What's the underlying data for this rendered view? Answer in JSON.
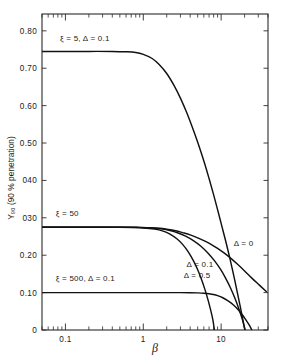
{
  "chart_data": {
    "type": "line",
    "title": "",
    "xlabel": "β",
    "ylabel": "Y₉₀ (90 % penetration)",
    "xscale": "log",
    "yscale": "linear",
    "xlim": [
      0.05,
      40
    ],
    "ylim": [
      0,
      0.845
    ],
    "grid": false,
    "legend_position": "inline-annotations",
    "xtick_labels": [
      "0.1",
      "1",
      "10"
    ],
    "xtick_values": [
      0.1,
      1,
      10
    ],
    "ytick_labels": [
      "0",
      "0.10",
      "0.20",
      "030",
      "040",
      "0.50",
      "0.60",
      "0.70",
      "0.80"
    ],
    "ytick_values": [
      0,
      0.1,
      0.2,
      0.3,
      0.4,
      0.5,
      0.6,
      0.7,
      0.8
    ],
    "annotations": [
      {
        "text": "ξ = 5, Δ = 0.1",
        "x": 0.085,
        "y": 0.772
      },
      {
        "text": "ξ = 50",
        "x": 0.075,
        "y": 0.305
      },
      {
        "text": "ξ = 500, Δ = 0.1",
        "x": 0.075,
        "y": 0.132
      },
      {
        "text": "Δ = 0",
        "x": 14.5,
        "y": 0.224
      },
      {
        "text": "Δ = 0.1",
        "x": 3.6,
        "y": 0.168
      },
      {
        "text": "Δ = 0.5",
        "x": 3.3,
        "y": 0.14
      }
    ],
    "series": [
      {
        "name": "ξ = 5, Δ = 0.1",
        "plateau": 0.745,
        "points": [
          [
            0.05,
            0.745
          ],
          [
            0.1,
            0.745
          ],
          [
            0.2,
            0.745
          ],
          [
            0.4,
            0.745
          ],
          [
            0.6,
            0.744
          ],
          [
            0.8,
            0.742
          ],
          [
            1.0,
            0.737
          ],
          [
            1.3,
            0.726
          ],
          [
            1.6,
            0.71
          ],
          [
            2.0,
            0.686
          ],
          [
            2.5,
            0.653
          ],
          [
            3.0,
            0.62
          ],
          [
            3.6,
            0.582
          ],
          [
            4.3,
            0.54
          ],
          [
            5.0,
            0.502
          ],
          [
            6.0,
            0.452
          ],
          [
            7.0,
            0.405
          ],
          [
            8.0,
            0.362
          ],
          [
            9.0,
            0.322
          ],
          [
            10.0,
            0.285
          ],
          [
            11.5,
            0.236
          ],
          [
            13.0,
            0.19
          ],
          [
            15.0,
            0.132
          ],
          [
            17.0,
            0.078
          ],
          [
            19.0,
            0.028
          ],
          [
            20.2,
            0.0
          ]
        ]
      },
      {
        "name": "ξ = 50, Δ = 0",
        "plateau": 0.275,
        "points": [
          [
            0.05,
            0.275
          ],
          [
            0.3,
            0.275
          ],
          [
            0.8,
            0.2745
          ],
          [
            1.2,
            0.2735
          ],
          [
            1.6,
            0.272
          ],
          [
            2.0,
            0.2695
          ],
          [
            2.6,
            0.2655
          ],
          [
            3.2,
            0.2605
          ],
          [
            4.0,
            0.2545
          ],
          [
            5.0,
            0.2465
          ],
          [
            6.2,
            0.2375
          ],
          [
            7.5,
            0.2285
          ],
          [
            9.0,
            0.2185
          ],
          [
            11.0,
            0.2055
          ],
          [
            13.0,
            0.1935
          ],
          [
            16.0,
            0.177
          ],
          [
            20.0,
            0.158
          ],
          [
            25.0,
            0.138
          ],
          [
            31.0,
            0.12
          ],
          [
            38.0,
            0.103
          ]
        ]
      },
      {
        "name": "ξ = 50, Δ = 0.1",
        "plateau": 0.275,
        "points": [
          [
            0.05,
            0.275
          ],
          [
            0.4,
            0.275
          ],
          [
            0.9,
            0.2745
          ],
          [
            1.3,
            0.273
          ],
          [
            1.7,
            0.2705
          ],
          [
            2.2,
            0.266
          ],
          [
            2.8,
            0.2595
          ],
          [
            3.5,
            0.251
          ],
          [
            4.4,
            0.239
          ],
          [
            5.5,
            0.224
          ],
          [
            6.8,
            0.2055
          ],
          [
            8.2,
            0.1855
          ],
          [
            9.8,
            0.1625
          ],
          [
            11.5,
            0.1375
          ],
          [
            13.2,
            0.1125
          ],
          [
            15.0,
            0.0855
          ],
          [
            17.0,
            0.055
          ],
          [
            18.8,
            0.027
          ],
          [
            20.3,
            0.0
          ]
        ]
      },
      {
        "name": "ξ = 50, Δ = 0.5",
        "plateau": 0.275,
        "points": [
          [
            0.05,
            0.275
          ],
          [
            0.5,
            0.2748
          ],
          [
            1.0,
            0.273
          ],
          [
            1.4,
            0.27
          ],
          [
            1.8,
            0.2645
          ],
          [
            2.2,
            0.2565
          ],
          [
            2.7,
            0.244
          ],
          [
            3.2,
            0.229
          ],
          [
            3.8,
            0.2085
          ],
          [
            4.4,
            0.1855
          ],
          [
            5.0,
            0.161
          ],
          [
            5.6,
            0.135
          ],
          [
            6.2,
            0.108
          ],
          [
            6.8,
            0.08
          ],
          [
            7.3,
            0.055
          ],
          [
            7.8,
            0.029
          ],
          [
            8.2,
            0.0
          ]
        ]
      },
      {
        "name": "ξ = 500, Δ = 0.1",
        "plateau": 0.1,
        "points": [
          [
            0.05,
            0.1
          ],
          [
            1.0,
            0.1
          ],
          [
            2.0,
            0.1
          ],
          [
            3.0,
            0.0999
          ],
          [
            4.0,
            0.0997
          ],
          [
            5.0,
            0.0993
          ],
          [
            6.0,
            0.0985
          ],
          [
            7.0,
            0.097
          ],
          [
            8.0,
            0.0948
          ],
          [
            9.0,
            0.0918
          ],
          [
            10.5,
            0.0862
          ],
          [
            12.0,
            0.0795
          ],
          [
            13.5,
            0.0718
          ],
          [
            15.0,
            0.0635
          ],
          [
            17.0,
            0.0515
          ],
          [
            19.0,
            0.0388
          ],
          [
            21.0,
            0.0258
          ],
          [
            23.0,
            0.013
          ],
          [
            24.8,
            0.0
          ]
        ]
      }
    ]
  },
  "plot": {
    "frame": {
      "left": 42,
      "top": 14,
      "right": 268,
      "bottom": 330
    }
  }
}
